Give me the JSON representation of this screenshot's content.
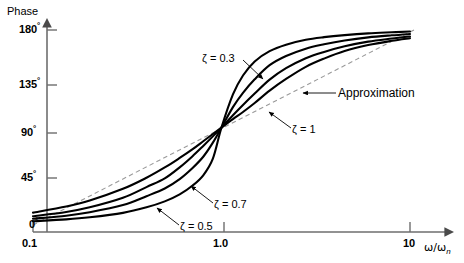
{
  "chart_data": {
    "type": "line",
    "title": "",
    "xlabel": "ω/ωn",
    "ylabel": "Phase",
    "xscale": "log",
    "xlim": [
      0.1,
      10
    ],
    "ylim": [
      0,
      180
    ],
    "grid": false,
    "x_ticks": [
      {
        "value": 0.1,
        "label": "0.1"
      },
      {
        "value": 1.0,
        "label": "1.0"
      },
      {
        "value": 10,
        "label": "10"
      }
    ],
    "y_ticks": [
      {
        "value": 0,
        "label": "0",
        "unit": "°"
      },
      {
        "value": 45,
        "label": "45",
        "unit": "°"
      },
      {
        "value": 90,
        "label": "90",
        "unit": "°"
      },
      {
        "value": 135,
        "label": "135",
        "unit": "°"
      },
      {
        "value": 180,
        "label": "180",
        "unit": "°"
      }
    ],
    "legend_position": "inline-annotations",
    "series": [
      {
        "name": "ζ = 0.3",
        "zeta": 0.3,
        "style": "solid",
        "x": [
          0.1,
          0.15,
          0.2,
          0.3,
          0.4,
          0.5,
          0.6,
          0.7,
          0.8,
          0.9,
          1.0,
          1.15,
          1.3,
          1.5,
          1.8,
          2.2,
          2.8,
          3.5,
          4.5,
          6.0,
          8.0,
          10.0
        ],
        "y": [
          3.5,
          5.2,
          7.1,
          11.2,
          16.3,
          21.8,
          28.3,
          36.2,
          45.9,
          61.3,
          90.0,
          120.5,
          138.0,
          151.0,
          160.5,
          166.5,
          171.0,
          173.4,
          175.3,
          176.9,
          177.9,
          178.6
        ]
      },
      {
        "name": "ζ = 0.5",
        "zeta": 0.5,
        "style": "solid",
        "x": [
          0.1,
          0.15,
          0.2,
          0.3,
          0.4,
          0.5,
          0.6,
          0.7,
          0.8,
          0.9,
          1.0,
          1.15,
          1.3,
          1.5,
          1.8,
          2.2,
          2.8,
          3.5,
          4.5,
          6.0,
          8.0,
          10.0
        ],
        "y": [
          5.8,
          8.6,
          11.8,
          18.4,
          26.6,
          33.7,
          42.4,
          52.4,
          63.0,
          76.0,
          90.0,
          108.8,
          122.0,
          134.5,
          147.5,
          156.0,
          162.8,
          166.8,
          170.3,
          173.2,
          175.1,
          176.3
        ]
      },
      {
        "name": "ζ = 0.7",
        "zeta": 0.7,
        "style": "solid",
        "x": [
          0.1,
          0.15,
          0.2,
          0.3,
          0.4,
          0.5,
          0.6,
          0.7,
          0.8,
          0.9,
          1.0,
          1.15,
          1.3,
          1.5,
          1.8,
          2.2,
          2.8,
          3.5,
          4.5,
          6.0,
          8.0,
          10.0
        ],
        "y": [
          8.1,
          12.0,
          16.3,
          25.1,
          35.0,
          43.0,
          53.2,
          63.3,
          73.0,
          81.8,
          90.0,
          101.3,
          110.8,
          121.3,
          134.2,
          144.8,
          154.0,
          159.8,
          165.0,
          169.3,
          172.1,
          174.0
        ]
      },
      {
        "name": "ζ = 1",
        "zeta": 1.0,
        "style": "solid",
        "x": [
          0.1,
          0.15,
          0.2,
          0.3,
          0.4,
          0.5,
          0.6,
          0.7,
          0.8,
          0.9,
          1.0,
          1.15,
          1.3,
          1.5,
          1.8,
          2.2,
          2.8,
          3.5,
          4.5,
          6.0,
          8.0,
          10.0
        ],
        "y": [
          11.4,
          17.1,
          22.6,
          33.4,
          43.6,
          53.1,
          61.9,
          69.8,
          77.3,
          84.0,
          90.0,
          97.8,
          104.3,
          112.6,
          124.0,
          134.8,
          146.0,
          153.6,
          160.6,
          166.1,
          170.0,
          172.4
        ]
      },
      {
        "name": "Approximation",
        "style": "dashed",
        "x": [
          0.1,
          1.0,
          10.0
        ],
        "y": [
          0,
          90,
          180
        ]
      }
    ],
    "annotations": [
      {
        "text": "ζ = 0.3",
        "anchor_x": 0.52,
        "anchor_y": 152
      },
      {
        "text": "ζ = 1",
        "anchor_x": 1.55,
        "anchor_y": 112
      },
      {
        "text": "ζ = 0.7",
        "anchor_x": 0.62,
        "anchor_y": 52
      },
      {
        "text": "ζ = 0.5",
        "anchor_x": 0.43,
        "anchor_y": 30
      },
      {
        "text": "Approximation",
        "anchor_x": 2.4,
        "anchor_y": 124
      }
    ]
  },
  "axes": {
    "y_title": "Phase",
    "x_title_main": "ω/ω",
    "x_title_sub": "n",
    "y_tick_180": "180",
    "y_tick_135": "135",
    "y_tick_90": "90",
    "y_tick_45": "45",
    "y_tick_0": "0",
    "degree_symbol": "°",
    "x_tick_01": "0.1",
    "x_tick_10": "1.0",
    "x_tick_100": "10"
  },
  "labels": {
    "zeta_03": "ζ = 0.3",
    "zeta_05": "ζ = 0.5",
    "zeta_07": "ζ = 0.7",
    "zeta_1": "ζ = 1",
    "approximation": "Approximation"
  },
  "colors": {
    "curve": "#000000",
    "axis": "#6e6e6e",
    "approximation": "#8a8a8a",
    "text": "#000000",
    "background": "#ffffff"
  }
}
